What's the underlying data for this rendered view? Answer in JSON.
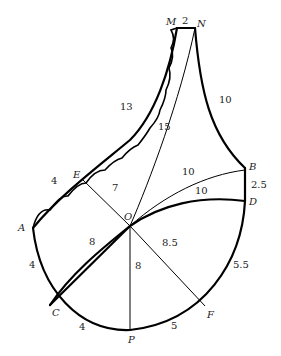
{
  "diagram": {
    "points": {
      "M": "M",
      "N": "N",
      "B": "B",
      "D": "D",
      "E": "E",
      "A": "A",
      "O": "O",
      "C": "C",
      "P": "P",
      "F": "F"
    },
    "measurements": {
      "MN": "2",
      "NB": "10",
      "ON": "15",
      "ME": "13",
      "EA": "4",
      "OE": "7",
      "OB": "10",
      "OD": "10",
      "BD": "2.5",
      "OC": "8",
      "OP": "8",
      "OF": "8.5",
      "AC": "4",
      "CP": "4",
      "PF": "5",
      "FD": "5.5"
    },
    "colors": {
      "line": "#000000",
      "background": "#ffffff"
    }
  }
}
